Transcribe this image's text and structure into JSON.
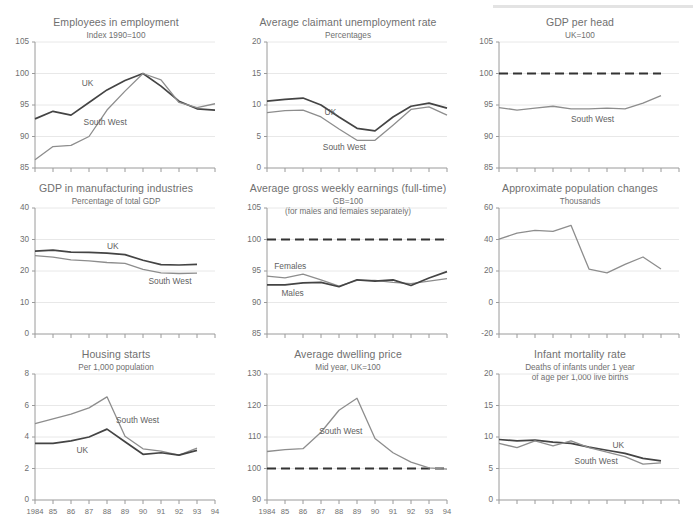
{
  "page": {
    "accent_dark": "#444444",
    "accent_light": "#8d8d8d",
    "grid_color": "#e8e8e8",
    "axis_color": "#9a9a9a"
  },
  "x_axis": {
    "tick_labels": [
      "1984",
      "85",
      "86",
      "87",
      "88",
      "89",
      "90",
      "91",
      "92",
      "93",
      "94"
    ],
    "min": 1984,
    "max": 1994
  },
  "chart_data": [
    {
      "id": "employees-in-employment",
      "type": "line",
      "title": "Employees in employment",
      "subtitle": "Index 1990=100",
      "xlabel": "",
      "ylabel": "",
      "ylim": [
        85,
        105
      ],
      "yticks": [
        85,
        90,
        95,
        100,
        105
      ],
      "grid": true,
      "x": [
        1984,
        1985,
        1986,
        1987,
        1988,
        1989,
        1990,
        1991,
        1992,
        1993,
        1994
      ],
      "series": [
        {
          "name": "UK",
          "color": "#444444",
          "values": [
            92.8,
            94.0,
            93.4,
            95.4,
            97.4,
            98.9,
            100.0,
            98.0,
            95.6,
            94.4,
            94.2
          ]
        },
        {
          "name": "South West",
          "color": "#8d8d8d",
          "values": [
            86.3,
            88.4,
            88.6,
            90.0,
            94.2,
            97.2,
            100.0,
            99.0,
            95.4,
            94.6,
            95.2
          ]
        }
      ],
      "annotations": [
        {
          "text": "UK",
          "x": 1986.6,
          "y": 98.4
        },
        {
          "text": "South West",
          "x": 1986.7,
          "y": 92.2
        }
      ],
      "x_tick_labels_visible": false
    },
    {
      "id": "average-claimant-unemployment-rate",
      "type": "line",
      "title": "Average claimant unemployment rate",
      "subtitle": "Percentages",
      "xlabel": "",
      "ylabel": "",
      "ylim": [
        0,
        20
      ],
      "yticks": [
        0,
        5,
        10,
        15,
        20
      ],
      "grid": true,
      "x": [
        1984,
        1985,
        1986,
        1987,
        1988,
        1989,
        1990,
        1991,
        1992,
        1993,
        1994
      ],
      "series": [
        {
          "name": "UK",
          "color": "#444444",
          "values": [
            10.6,
            10.9,
            11.1,
            10.0,
            8.1,
            6.3,
            5.9,
            8.1,
            9.8,
            10.3,
            9.5
          ]
        },
        {
          "name": "South West",
          "color": "#8d8d8d",
          "values": [
            8.8,
            9.1,
            9.2,
            8.1,
            6.2,
            4.4,
            4.4,
            6.8,
            9.3,
            9.7,
            8.4
          ]
        }
      ],
      "annotations": [
        {
          "text": "UK",
          "x": 1987.2,
          "y": 8.7
        },
        {
          "text": "South West",
          "x": 1987.1,
          "y": 3.2
        }
      ],
      "x_tick_labels_visible": false
    },
    {
      "id": "gdp-per-head",
      "type": "line",
      "title": "GDP per head",
      "subtitle": "UK=100",
      "xlabel": "",
      "ylabel": "",
      "ylim": [
        85,
        105
      ],
      "yticks": [
        85,
        90,
        95,
        100,
        105
      ],
      "grid": true,
      "x": [
        1984,
        1985,
        1986,
        1987,
        1988,
        1989,
        1990,
        1991,
        1992,
        1993
      ],
      "series": [
        {
          "name": "UK",
          "color": "#333333",
          "dashed": true,
          "values": [
            100,
            100,
            100,
            100,
            100,
            100,
            100,
            100,
            100,
            100
          ]
        },
        {
          "name": "South West",
          "color": "#8d8d8d",
          "values": [
            94.6,
            94.2,
            94.5,
            94.8,
            94.4,
            94.4,
            94.5,
            94.4,
            95.3,
            96.5
          ]
        }
      ],
      "annotations": [
        {
          "text": "South West",
          "x": 1988.0,
          "y": 92.6
        }
      ],
      "x_tick_labels_visible": false
    },
    {
      "id": "gdp-in-manufacturing-industries",
      "type": "line",
      "title": "GDP in manufacturing industries",
      "subtitle": "Percentage of total GDP",
      "xlabel": "",
      "ylabel": "",
      "ylim": [
        0,
        40
      ],
      "yticks": [
        0,
        10,
        20,
        30,
        40
      ],
      "grid": true,
      "x": [
        1984,
        1985,
        1986,
        1987,
        1988,
        1989,
        1990,
        1991,
        1992,
        1993
      ],
      "series": [
        {
          "name": "UK",
          "color": "#444444",
          "values": [
            26.3,
            26.6,
            26.0,
            25.9,
            25.7,
            25.2,
            23.4,
            22.0,
            21.9,
            22.1
          ]
        },
        {
          "name": "South West",
          "color": "#8d8d8d",
          "values": [
            24.9,
            24.4,
            23.5,
            23.2,
            22.7,
            22.4,
            20.5,
            19.4,
            19.2,
            19.3
          ]
        }
      ],
      "annotations": [
        {
          "text": "UK",
          "x": 1988.0,
          "y": 27.6
        },
        {
          "text": "South West",
          "x": 1990.3,
          "y": 16.6
        }
      ],
      "x_tick_labels_visible": false
    },
    {
      "id": "average-gross-weekly-earnings",
      "type": "line",
      "title": "Average gross weekly earnings (full-time)",
      "subtitle": "GB=100",
      "subtitle2": "(for males and females separately)",
      "xlabel": "",
      "ylabel": "",
      "ylim": [
        85,
        105
      ],
      "yticks": [
        85,
        90,
        95,
        100,
        105
      ],
      "grid": true,
      "x": [
        1984,
        1985,
        1986,
        1987,
        1988,
        1989,
        1990,
        1991,
        1992,
        1993,
        1994
      ],
      "series": [
        {
          "name": "GB",
          "color": "#333333",
          "dashed": true,
          "values": [
            100,
            100,
            100,
            100,
            100,
            100,
            100,
            100,
            100,
            100,
            100
          ]
        },
        {
          "name": "Females",
          "color": "#8d8d8d",
          "values": [
            94.2,
            93.9,
            94.5,
            93.6,
            92.6,
            93.5,
            93.5,
            93.2,
            93.0,
            93.4,
            93.8
          ]
        },
        {
          "name": "Males",
          "color": "#444444",
          "values": [
            92.8,
            92.8,
            93.1,
            93.2,
            92.5,
            93.6,
            93.4,
            93.6,
            92.7,
            93.9,
            94.9
          ]
        }
      ],
      "annotations": [
        {
          "text": "Females",
          "x": 1984.4,
          "y": 95.6
        },
        {
          "text": "Males",
          "x": 1984.8,
          "y": 91.3
        }
      ],
      "x_tick_labels_visible": false
    },
    {
      "id": "approximate-population-changes",
      "type": "line",
      "title": "Approximate population changes",
      "subtitle": "Thousands",
      "xlabel": "",
      "ylabel": "",
      "ylim": [
        -20,
        60
      ],
      "yticks": [
        -20,
        0,
        20,
        40,
        60
      ],
      "grid": true,
      "x": [
        1984,
        1985,
        1986,
        1987,
        1988,
        1989,
        1990,
        1991,
        1992
      ],
      "series": [
        {
          "name": "Approximate population changes",
          "color": "#8d8d8d",
          "values": [
            40.3,
            44.0,
            45.8,
            45.2,
            49.0,
            21.2,
            18.8,
            24.2,
            28.9
          ]
        }
      ],
      "annotations": [],
      "extra_points": [
        {
          "x": 1993,
          "y": 21.3
        }
      ],
      "x_tick_labels_visible": false
    },
    {
      "id": "housing-starts",
      "type": "line",
      "title": "Housing starts",
      "subtitle": "Per 1,000 population",
      "xlabel": "",
      "ylabel": "",
      "ylim": [
        0,
        8
      ],
      "yticks": [
        0,
        2,
        4,
        6,
        8
      ],
      "grid": true,
      "x": [
        1984,
        1985,
        1986,
        1987,
        1988,
        1989,
        1990,
        1991,
        1992,
        1993
      ],
      "series": [
        {
          "name": "South West",
          "color": "#8d8d8d",
          "values": [
            4.85,
            5.15,
            5.45,
            5.85,
            6.55,
            4.05,
            3.25,
            3.1,
            2.85,
            3.3
          ]
        },
        {
          "name": "UK",
          "color": "#444444",
          "values": [
            3.6,
            3.6,
            3.75,
            4.0,
            4.5,
            3.7,
            2.9,
            3.0,
            2.85,
            3.15
          ]
        }
      ],
      "annotations": [
        {
          "text": "South West",
          "x": 1988.5,
          "y": 5.0
        },
        {
          "text": "UK",
          "x": 1986.3,
          "y": 3.1
        }
      ],
      "x_tick_labels_visible": true
    },
    {
      "id": "average-dwelling-price",
      "type": "line",
      "title": "Average dwelling price",
      "subtitle": "Mid year, UK=100",
      "xlabel": "",
      "ylabel": "",
      "ylim": [
        90,
        130
      ],
      "yticks": [
        90,
        100,
        110,
        120,
        130
      ],
      "grid": true,
      "x": [
        1984,
        1985,
        1986,
        1987,
        1988,
        1989,
        1990,
        1991,
        1992,
        1993,
        1994
      ],
      "series": [
        {
          "name": "UK",
          "color": "#333333",
          "dashed": true,
          "values": [
            100,
            100,
            100,
            100,
            100,
            100,
            100,
            100,
            100,
            100,
            100
          ]
        },
        {
          "name": "South West",
          "color": "#8d8d8d",
          "values": [
            105.4,
            106.0,
            106.3,
            111.5,
            118.5,
            122.3,
            109.5,
            105.0,
            102.0,
            100.2,
            99.8
          ]
        }
      ],
      "annotations": [
        {
          "text": "South West",
          "x": 1986.9,
          "y": 111.5
        }
      ],
      "x_tick_labels_visible": true
    },
    {
      "id": "infant-mortality-rate",
      "type": "line",
      "title": "Infant mortality rate",
      "subtitle": "Deaths of infants under 1 year",
      "subtitle2": "of age per 1,000 live births",
      "xlabel": "",
      "ylabel": "",
      "ylim": [
        0,
        20
      ],
      "yticks": [
        0,
        5,
        10,
        15,
        20
      ],
      "grid": true,
      "x": [
        1984,
        1985,
        1986,
        1987,
        1988,
        1989,
        1990,
        1991,
        1992,
        1993
      ],
      "series": [
        {
          "name": "UK",
          "color": "#444444",
          "values": [
            9.6,
            9.4,
            9.5,
            9.2,
            9.0,
            8.4,
            7.9,
            7.4,
            6.6,
            6.2
          ]
        },
        {
          "name": "South West",
          "color": "#8d8d8d",
          "values": [
            9.0,
            8.3,
            9.4,
            8.6,
            9.4,
            8.3,
            7.6,
            6.9,
            5.7,
            5.9
          ]
        }
      ],
      "annotations": [
        {
          "text": "UK",
          "x": 1990.3,
          "y": 8.6
        },
        {
          "text": "South West",
          "x": 1988.2,
          "y": 6.1
        }
      ],
      "x_tick_labels_visible": false
    }
  ]
}
